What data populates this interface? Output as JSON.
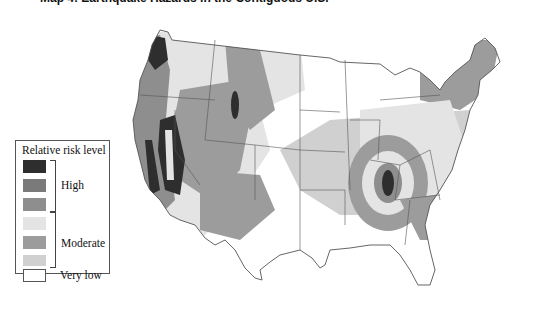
{
  "title": "Map 4: Earthquake Hazards in the Contiguous U.S.",
  "legend": {
    "title": "Relative risk level",
    "groups": [
      {
        "label": "High",
        "swatches": [
          "#2e2e2e",
          "#7a7a7a",
          "#8e8e8e"
        ]
      },
      {
        "label": "Moderate",
        "swatches": [
          "#e4e4e4",
          "#9c9c9c",
          "#d0d0d0"
        ]
      },
      {
        "label": "Very low",
        "swatches": [
          "#ffffff"
        ]
      }
    ]
  },
  "colors": {
    "very_low": "#ffffff",
    "moderate_light": "#e4e4e4",
    "moderate_mid": "#d0d0d0",
    "moderate_dark": "#9c9c9c",
    "high_light": "#8e8e8e",
    "high_mid": "#7a7a7a",
    "high_dark": "#2e2e2e",
    "borders": "#555555"
  }
}
